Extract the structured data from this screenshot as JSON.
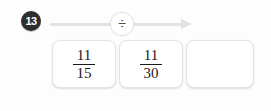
{
  "exercise": {
    "number_badge": "13",
    "operation": {
      "symbol": "÷",
      "name": "division",
      "arrow_direction": "right"
    },
    "tiles": [
      {
        "kind": "fraction",
        "numerator": "11",
        "denominator": "15",
        "empty": false
      },
      {
        "kind": "fraction",
        "numerator": "11",
        "denominator": "30",
        "empty": false
      },
      {
        "kind": "answer",
        "numerator": "",
        "denominator": "",
        "empty": true
      }
    ]
  },
  "colors": {
    "badge_background": "#2e2e2e",
    "badge_text": "#ffffff",
    "arrow": "#e2e2e2",
    "tile_border": "#e4e4e4",
    "tile_background": "#ffffff",
    "text": "#1a1a1a",
    "page_background": "#fdfdfd"
  }
}
